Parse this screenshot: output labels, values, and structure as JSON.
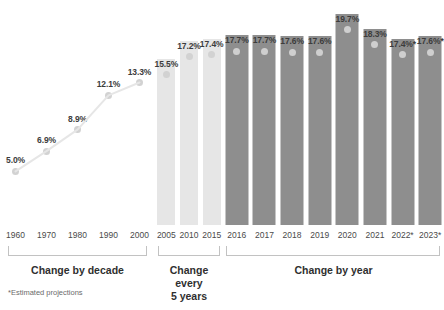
{
  "footnote": "*Estimated projections",
  "colors": {
    "bar_light": "#e6e6e6",
    "bar_dark": "#8e8e8e",
    "dot": "#d2d2d2",
    "dot_on_dark": "#cfcfcf",
    "label_text": "#3c3c3c",
    "bracket": "#c2c2c2",
    "background": "#ffffff"
  },
  "groups": [
    {
      "caption": "Change by decade"
    },
    {
      "caption": "Change every\n5 years"
    },
    {
      "caption": "Change by year"
    }
  ],
  "chart_data": [
    {
      "type": "line",
      "title": "Change by decade",
      "categories": [
        "1960",
        "1970",
        "1980",
        "1990",
        "2000"
      ],
      "values": [
        5.0,
        6.9,
        8.9,
        12.1,
        13.3
      ],
      "labels": [
        "5.0%",
        "6.9%",
        "8.9%",
        "12.1%",
        "13.3%"
      ],
      "xlabel": "",
      "ylabel": "",
      "ylim": [
        0,
        21
      ],
      "grid": false,
      "legend": "none"
    },
    {
      "type": "bar",
      "title": "Change every 5 years",
      "categories": [
        "2005",
        "2010",
        "2015"
      ],
      "values": [
        15.5,
        17.2,
        17.4
      ],
      "labels": [
        "15.5%",
        "17.2%",
        "17.4%"
      ],
      "xlabel": "",
      "ylabel": "",
      "ylim": [
        0,
        21
      ],
      "grid": false,
      "legend": "none"
    },
    {
      "type": "bar",
      "title": "Change by year",
      "categories": [
        "2016",
        "2017",
        "2018",
        "2019",
        "2020",
        "2021",
        "2022*",
        "2023*"
      ],
      "values": [
        17.7,
        17.7,
        17.6,
        17.6,
        19.7,
        18.3,
        17.4,
        17.6
      ],
      "labels": [
        "17.7%",
        "17.7%",
        "17.6%",
        "17.6%",
        "19.7%",
        "18.3%",
        "17.4%*",
        "17.6%*"
      ],
      "estimated": [
        false,
        false,
        false,
        false,
        false,
        false,
        true,
        true
      ],
      "xlabel": "",
      "ylabel": "",
      "ylim": [
        0,
        21
      ],
      "grid": false,
      "legend": "none"
    }
  ]
}
